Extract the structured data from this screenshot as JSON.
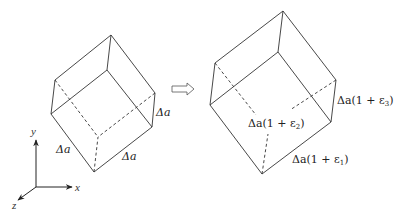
{
  "figure": {
    "left_cube": {
      "name": "undeformed-element",
      "vertices": {
        "top": [
          111,
          35
        ],
        "left_top": [
          55,
          80
        ],
        "left_bottom": [
          51,
          114
        ],
        "front_top": [
          107,
          70
        ],
        "right_top": [
          155,
          93
        ],
        "right_bottom": [
          152,
          127
        ],
        "bottom": [
          94,
          172
        ],
        "hidden": [
          98,
          137
        ]
      },
      "labels": [
        {
          "text": "Δa",
          "x": 56,
          "y": 144
        },
        {
          "text": "Δa",
          "x": 122,
          "y": 151
        },
        {
          "text": "Δa",
          "x": 156,
          "y": 107
        }
      ]
    },
    "transition_arrow": {
      "symbol": "⇨",
      "x1": 171,
      "x2": 194,
      "y": 89
    },
    "right_cube": {
      "name": "deformed-element",
      "vertices": {
        "top": [
          283,
          11
        ],
        "left_top": [
          215,
          63
        ],
        "left_bottom": [
          210,
          105
        ],
        "front_top": [
          278,
          52
        ],
        "right_top": [
          336,
          80
        ],
        "right_bottom": [
          331,
          122
        ],
        "bottom": [
          262,
          174
        ],
        "hidden": [
          268,
          127
        ]
      },
      "labels": {
        "eps1": {
          "prefix": "Δa(1 + ε",
          "sub": "1",
          "suffix": ")"
        },
        "eps2": {
          "prefix": "Δa(1 + ε",
          "sub": "2",
          "suffix": ")"
        },
        "eps3": {
          "prefix": "Δa(1 + ε",
          "sub": "3",
          "suffix": ")"
        }
      }
    },
    "axes": {
      "origin": [
        36,
        187
      ],
      "x_label": "x",
      "y_label": "y",
      "z_label": "z"
    },
    "line_color": "#333333"
  }
}
